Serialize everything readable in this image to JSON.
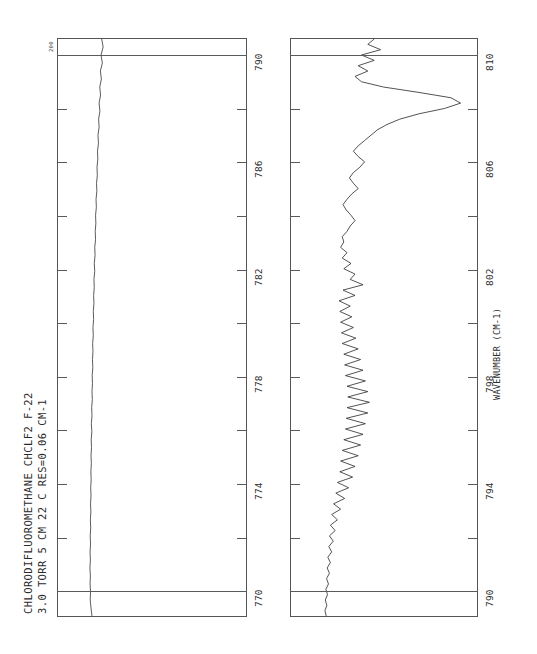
{
  "meta": {
    "title_line_1": "CHLORODIFLUOROMETHANE   CHCLF2    F-22",
    "title_line_2": "3.0 TORR  5 CM  22 C      RES=0.06 CM-1",
    "compound_name": "CHLORODIFLUOROMETHANE",
    "formula": "CHCLF2",
    "refrigerant_code": "F-22",
    "pressure": "3.0 TORR",
    "path_length": "5 CM",
    "temperature": "22 C",
    "resolution": "RES=0.06 CM-1",
    "axis_label": "WAVENUMBER (CM-1)",
    "scale_label": "200"
  },
  "chart_data": {
    "type": "line",
    "title": "CHLORODIFLUOROMETHANE   CHCLF2    F-22",
    "subtitle": "3.0 TORR  5 CM  22 C      RES=0.06 CM-1",
    "xlabel": "WAVENUMBER (CM-1)",
    "ylabel": "",
    "orientation": "rotated-90-ccw",
    "grid": true,
    "legend_position": "none",
    "panels": [
      {
        "name": "panel-1",
        "xlim": [
          769,
          790.6
        ],
        "ticks": [
          790,
          788,
          786,
          784,
          782,
          780,
          778,
          776,
          774,
          772,
          770
        ],
        "labeled_ticks": [
          790,
          786,
          782,
          778,
          774,
          770
        ],
        "major_gridlines": [
          790,
          770
        ],
        "ylim": [
          0,
          100
        ],
        "x": [
          769.0,
          769.3,
          769.6,
          769.9,
          770.2,
          770.5,
          770.8,
          771.1,
          771.4,
          771.7,
          772.0,
          772.3,
          772.6,
          772.9,
          773.2,
          773.5,
          773.8,
          774.1,
          774.4,
          774.7,
          775.0,
          775.3,
          775.6,
          775.9,
          776.2,
          776.5,
          776.8,
          777.1,
          777.4,
          777.7,
          778.0,
          778.3,
          778.6,
          778.9,
          779.2,
          779.5,
          779.8,
          780.1,
          780.4,
          780.7,
          781.0,
          781.3,
          781.6,
          781.9,
          782.2,
          782.5,
          782.8,
          783.1,
          783.4,
          783.7,
          784.0,
          784.3,
          784.6,
          784.9,
          785.2,
          785.5,
          785.8,
          786.1,
          786.4,
          786.7,
          787.0,
          787.3,
          787.6,
          787.9,
          788.2,
          788.5,
          788.8,
          789.1,
          789.4,
          789.7,
          790.0,
          790.3,
          790.6
        ],
        "y": [
          3.0,
          2.4,
          1.9,
          2.1,
          1.8,
          2.0,
          1.7,
          2.0,
          1.8,
          2.1,
          1.9,
          2.2,
          2.0,
          2.3,
          2.1,
          2.4,
          2.2,
          2.5,
          2.3,
          2.6,
          2.4,
          2.7,
          2.5,
          2.9,
          2.6,
          3.0,
          2.8,
          3.2,
          3.0,
          3.3,
          3.1,
          3.5,
          3.3,
          3.6,
          3.4,
          3.8,
          3.6,
          4.0,
          3.8,
          4.2,
          4.0,
          4.4,
          4.2,
          4.7,
          4.4,
          4.9,
          4.7,
          5.2,
          5.0,
          5.4,
          5.2,
          5.7,
          5.5,
          6.0,
          5.8,
          6.3,
          6.1,
          6.6,
          6.4,
          7.0,
          6.7,
          7.4,
          7.1,
          7.9,
          7.4,
          8.3,
          7.8,
          8.8,
          8.2,
          9.4,
          8.6,
          9.9,
          9.0
        ]
      },
      {
        "name": "panel-2",
        "xlim": [
          789,
          810.6
        ],
        "ticks": [
          810,
          808,
          806,
          804,
          802,
          800,
          798,
          796,
          794,
          792,
          790
        ],
        "labeled_ticks": [
          810,
          806,
          802,
          798,
          794,
          790
        ],
        "major_gridlines": [
          810,
          790
        ],
        "ylim": [
          0,
          100
        ],
        "band_center": 808.5,
        "band_description": "Strong absorption band with dense rotational fine structure; Q-branch maximum near 808.5 cm-1, densely spaced lines from 793 to 802 cm-1",
        "x": [
          789.0,
          789.2,
          789.4,
          789.6,
          789.8,
          790.0,
          790.2,
          790.4,
          790.6,
          790.8,
          791.0,
          791.2,
          791.4,
          791.6,
          791.8,
          792.0,
          792.2,
          792.4,
          792.6,
          792.8,
          793.0,
          793.2,
          793.4,
          793.6,
          793.8,
          794.0,
          794.2,
          794.4,
          794.6,
          794.8,
          795.0,
          795.2,
          795.4,
          795.6,
          795.8,
          796.0,
          796.2,
          796.4,
          796.6,
          796.8,
          797.0,
          797.2,
          797.4,
          797.6,
          797.8,
          798.0,
          798.2,
          798.4,
          798.6,
          798.8,
          799.0,
          799.2,
          799.4,
          799.6,
          799.8,
          800.0,
          800.2,
          800.4,
          800.6,
          800.8,
          801.0,
          801.2,
          801.4,
          801.6,
          801.8,
          802.0,
          802.2,
          802.4,
          802.6,
          802.8,
          803.0,
          803.2,
          803.4,
          803.6,
          803.8,
          804.0,
          804.2,
          804.4,
          804.6,
          804.8,
          805.0,
          805.2,
          805.4,
          805.6,
          805.8,
          806.0,
          806.2,
          806.4,
          806.6,
          806.8,
          807.0,
          807.2,
          807.4,
          807.6,
          807.8,
          808.0,
          808.2,
          808.4,
          808.6,
          808.8,
          809.0,
          809.2,
          809.4,
          809.6,
          809.8,
          810.0,
          810.2,
          810.4,
          810.6
        ],
        "y": [
          4.0,
          3.2,
          4.4,
          3.4,
          4.8,
          3.8,
          5.4,
          4.2,
          6.0,
          4.6,
          6.6,
          5.0,
          7.4,
          5.6,
          8.4,
          6.0,
          9.6,
          6.6,
          11.0,
          7.4,
          13.0,
          8.6,
          15.5,
          10.0,
          18.0,
          11.0,
          20.5,
          12.5,
          22.0,
          13.0,
          24.0,
          14.0,
          25.5,
          15.0,
          27.0,
          16.0,
          28.5,
          16.5,
          30.0,
          17.0,
          31.0,
          17.5,
          30.0,
          17.0,
          28.5,
          16.0,
          27.0,
          15.5,
          25.5,
          15.0,
          24.0,
          14.0,
          22.5,
          13.5,
          21.0,
          13.0,
          20.0,
          12.5,
          19.0,
          12.0,
          22.0,
          14.5,
          27.0,
          19.0,
          22.0,
          15.0,
          19.5,
          14.0,
          17.0,
          13.0,
          15.0,
          14.0,
          17.0,
          19.0,
          22.0,
          19.5,
          16.5,
          14.5,
          17.0,
          20.0,
          24.0,
          21.0,
          18.5,
          21.0,
          25.0,
          28.0,
          24.0,
          21.0,
          24.0,
          28.0,
          32.0,
          36.0,
          42.0,
          50.0,
          62.0,
          78.0,
          88.0,
          82.0,
          62.0,
          40.0,
          26.0,
          22.0,
          30.0,
          24.0,
          34.0,
          26.0,
          38.0,
          30.0,
          34.0
        ]
      }
    ]
  }
}
